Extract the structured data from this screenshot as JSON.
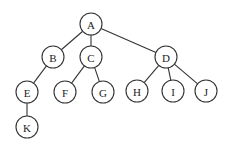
{
  "diagram": {
    "type": "tree",
    "colors": {
      "stroke": "#333333",
      "fill": "#ffffff",
      "text": "#222222"
    },
    "node_radius": 11,
    "nodes": [
      {
        "id": "A",
        "label": "A",
        "x": 91,
        "y": 24
      },
      {
        "id": "B",
        "label": "B",
        "x": 53,
        "y": 57
      },
      {
        "id": "C",
        "label": "C",
        "x": 91,
        "y": 57
      },
      {
        "id": "D",
        "label": "D",
        "x": 166,
        "y": 57
      },
      {
        "id": "E",
        "label": "E",
        "x": 27,
        "y": 92
      },
      {
        "id": "F",
        "label": "F",
        "x": 65,
        "y": 92
      },
      {
        "id": "G",
        "label": "G",
        "x": 103,
        "y": 92
      },
      {
        "id": "H",
        "label": "H",
        "x": 137,
        "y": 91
      },
      {
        "id": "I",
        "label": "I",
        "x": 173,
        "y": 91
      },
      {
        "id": "J",
        "label": "J",
        "x": 206,
        "y": 91
      },
      {
        "id": "K",
        "label": "K",
        "x": 27,
        "y": 127
      }
    ],
    "edges": [
      [
        "A",
        "B"
      ],
      [
        "A",
        "C"
      ],
      [
        "A",
        "D"
      ],
      [
        "B",
        "E"
      ],
      [
        "C",
        "F"
      ],
      [
        "C",
        "G"
      ],
      [
        "D",
        "H"
      ],
      [
        "D",
        "I"
      ],
      [
        "D",
        "J"
      ],
      [
        "E",
        "K"
      ]
    ]
  }
}
